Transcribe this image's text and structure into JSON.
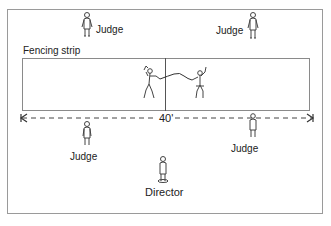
{
  "diagram": {
    "strip_label": "Fencing strip",
    "dimension_label": "40'",
    "officials": [
      {
        "role": "Judge",
        "position": "top-left"
      },
      {
        "role": "Judge",
        "position": "top-right"
      },
      {
        "role": "Judge",
        "position": "bottom-left"
      },
      {
        "role": "Judge",
        "position": "bottom-right"
      },
      {
        "role": "Director",
        "position": "bottom-center"
      }
    ],
    "fencers": [
      {
        "position": "left"
      },
      {
        "position": "right"
      }
    ],
    "colors": {
      "line": "#555555",
      "border": "#9a9a9a",
      "background": "#ffffff"
    }
  }
}
